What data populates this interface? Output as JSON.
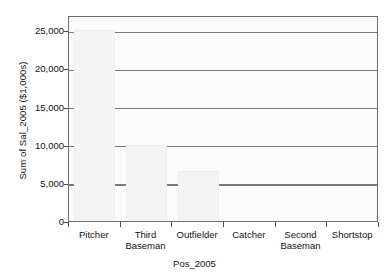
{
  "chart_data": {
    "type": "bar",
    "title": "",
    "xlabel": "Pos_2005",
    "ylabel": "Sum of Sal_2005 ($1,000s)",
    "categories": [
      "Pitcher",
      "Third Baseman",
      "Outfielder",
      "Catcher",
      "Second Baseman",
      "Shortstop"
    ],
    "values": [
      25000,
      10000,
      6500,
      0,
      0,
      0
    ],
    "ylim": [
      0,
      27000
    ],
    "yticks": [
      0,
      5000,
      10000,
      15000,
      20000,
      25000
    ],
    "ytick_labels": [
      "0",
      "5,000",
      "10,000",
      "15,000",
      "20,000",
      "25,000"
    ],
    "grid": true,
    "legend": "none",
    "bar_color": "#f4f4f4",
    "gridline_color": "#7b7b7b",
    "axis_color": "#6d6d6d"
  },
  "axes": {
    "y_title": "Sum of Sal_2005 ($1,000s)",
    "x_title": "Pos_2005"
  },
  "x_labels": [
    {
      "line1": "Pitcher",
      "line2": ""
    },
    {
      "line1": "Third",
      "line2": "Baseman"
    },
    {
      "line1": "Outfielder",
      "line2": ""
    },
    {
      "line1": "Catcher",
      "line2": ""
    },
    {
      "line1": "Second",
      "line2": "Baseman"
    },
    {
      "line1": "Shortstop",
      "line2": ""
    }
  ]
}
